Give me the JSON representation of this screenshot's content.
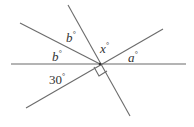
{
  "diagram": {
    "type": "intersecting-lines-angles",
    "intersection": {
      "x": 100,
      "y": 64
    },
    "lines": [
      {
        "name": "horizontal-line",
        "x1": 11,
        "y1": 64,
        "x2": 186,
        "y2": 64
      },
      {
        "name": "upper-left-ray",
        "x1": 20,
        "y1": 23,
        "x2": 100,
        "y2": 64
      },
      {
        "name": "steep-line",
        "x1": 68,
        "y1": 5,
        "x2": 130,
        "y2": 116
      },
      {
        "name": "rising-line",
        "x1": 26,
        "y1": 108,
        "x2": 163,
        "y2": 29
      }
    ],
    "right_angle_marker": {
      "points": "96,66 101,75 110,70 105,61"
    },
    "labels": {
      "b_upper": {
        "text": "b",
        "sup": "°",
        "x": 68,
        "y": 41
      },
      "b_lower": {
        "text": "b",
        "sup": "°",
        "x": 53,
        "y": 60
      },
      "x": {
        "text": "x",
        "sup": "°",
        "x": 101,
        "y": 51
      },
      "a": {
        "text": "a",
        "sup": "°",
        "x": 129,
        "y": 62
      },
      "thirty": {
        "text": "30",
        "sup": "°",
        "x": 50,
        "y": 83
      }
    }
  }
}
